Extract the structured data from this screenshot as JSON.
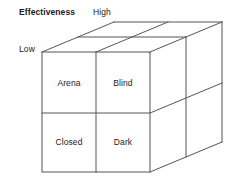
{
  "figure": {
    "name": "johari-window-cube",
    "stroke_color": "#555555",
    "text_color": "#1a1a1a",
    "background_color": "#ffffff"
  },
  "axes": {
    "effectiveness_label": "Effectiveness",
    "high_label": "High",
    "low_label": "Low"
  },
  "quadrants": [
    {
      "label": "Arena"
    },
    {
      "label": "Blind"
    },
    {
      "label": "Closed"
    },
    {
      "label": "Dark"
    }
  ]
}
